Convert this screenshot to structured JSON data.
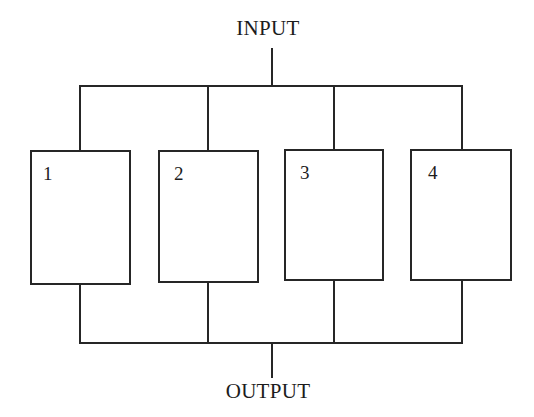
{
  "diagram": {
    "type": "block-diagram",
    "background_color": "#ffffff",
    "line_color": "#262626",
    "line_width_px": 2,
    "ports": {
      "input_label": "INPUT",
      "output_label": "OUTPUT"
    },
    "blocks": [
      {
        "id": "block-1",
        "label": "1",
        "x": 31,
        "y": 151,
        "width": 99,
        "height": 133
      },
      {
        "id": "block-2",
        "label": "2",
        "x": 159,
        "y": 151,
        "width": 99,
        "height": 131
      },
      {
        "id": "block-3",
        "label": "3",
        "x": 285,
        "y": 150,
        "width": 98,
        "height": 130
      },
      {
        "id": "block-4",
        "label": "4",
        "x": 411,
        "y": 150,
        "width": 100,
        "height": 130
      }
    ],
    "buses": {
      "top_bus_y": 86,
      "bottom_bus_y": 343,
      "bus_left_x": 80,
      "bus_right_x": 462,
      "stub_x": 272,
      "input_stub_top_y": 48,
      "output_stub_bottom_y": 378
    },
    "connector_x_positions": [
      80,
      208,
      334,
      462
    ]
  }
}
